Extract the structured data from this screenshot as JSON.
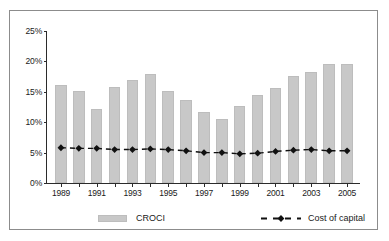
{
  "chart_data": {
    "type": "bar",
    "title": "",
    "xlabel": "",
    "ylabel": "",
    "ylim": [
      0,
      25
    ],
    "ytick_labels": [
      "0%",
      "5%",
      "10%",
      "15%",
      "20%",
      "25%"
    ],
    "ytick_values": [
      0,
      5,
      10,
      15,
      20,
      25
    ],
    "grid": false,
    "legend_position": "bottom",
    "categories": [
      "1989",
      "1990",
      "1991",
      "1992",
      "1993",
      "1994",
      "1995",
      "1996",
      "1997",
      "1998",
      "1999",
      "2000",
      "2001",
      "2002",
      "2003",
      "2004",
      "2005"
    ],
    "xtick_labels": [
      "1989",
      "",
      "1991",
      "",
      "1993",
      "",
      "1995",
      "",
      "1997",
      "",
      "1999",
      "",
      "2001",
      "",
      "2003",
      "",
      "2005"
    ],
    "series": [
      {
        "name": "CROCI",
        "type": "bar",
        "color": "#c8c8c8",
        "values": [
          16.1,
          15.2,
          12.1,
          15.8,
          17.0,
          17.9,
          15.2,
          13.7,
          11.6,
          10.5,
          12.7,
          14.4,
          15.7,
          17.6,
          18.3,
          19.5,
          19.5
        ]
      },
      {
        "name": "Cost of capital",
        "type": "line",
        "color": "#111111",
        "marker": "diamond",
        "dash": "dashed",
        "values": [
          5.8,
          5.7,
          5.7,
          5.5,
          5.5,
          5.6,
          5.5,
          5.3,
          5.0,
          5.0,
          4.8,
          4.9,
          5.2,
          5.4,
          5.5,
          5.3,
          5.3
        ]
      }
    ]
  },
  "legend": {
    "croci_label": "CROCI",
    "cost_of_capital_label": "Cost of capital"
  }
}
